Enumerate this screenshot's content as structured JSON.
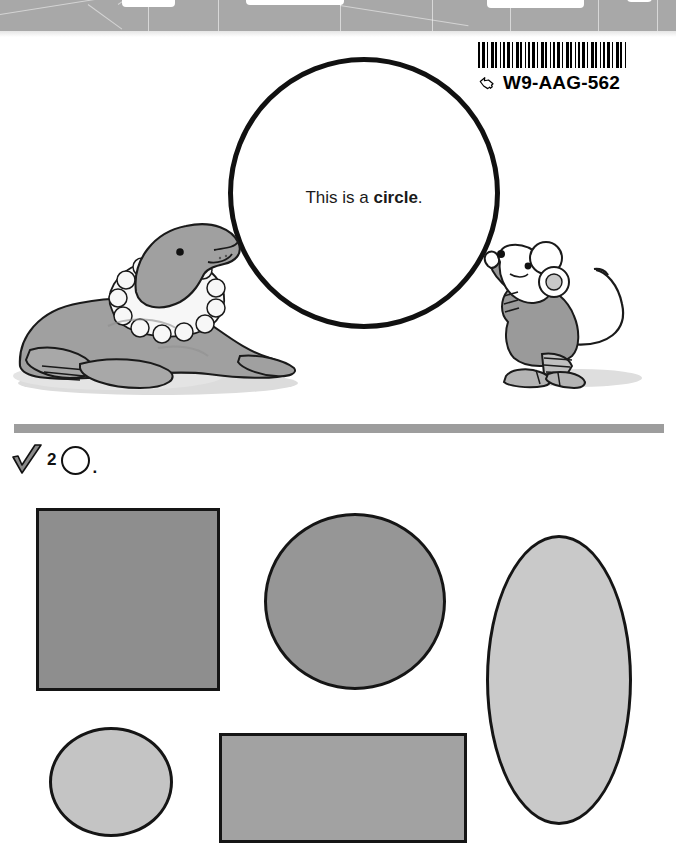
{
  "page": {
    "background_color": "#ffffff",
    "width": 676,
    "height": 868
  },
  "scan_band": {
    "name": "page-edge-scan-artifact",
    "color": "#a8a8a8",
    "notches": [
      {
        "left": 122,
        "width": 53,
        "height": 11
      },
      {
        "left": 246,
        "width": 98,
        "height": 9
      },
      {
        "left": 487,
        "width": 97,
        "height": 12
      },
      {
        "left": 627,
        "width": 25,
        "height": 6
      }
    ]
  },
  "barcode": {
    "code": "W9-AAG-562",
    "hand_icon": "hand-pointer-icon",
    "stripes_label": "barcode-stripes"
  },
  "lesson": {
    "caption_prefix": "This is a ",
    "caption_bold": "circle",
    "caption_suffix": ".",
    "shape_outline_color": "#111111"
  },
  "illustrations": {
    "seal": {
      "name": "seal-illustration",
      "body_color": "#a0a0a0",
      "collar_color": "#f7f7f7",
      "outline_color": "#1a1a1a",
      "shadow_color": "#d9d9d9"
    },
    "mouse": {
      "name": "mouse-illustration",
      "body_color": "#ffffff",
      "dress_color": "#9a9a9a",
      "outline_color": "#1a1a1a",
      "shadow_color": "#d9d9d9"
    }
  },
  "divider": {
    "color": "#9d9d9d"
  },
  "exercise": {
    "check_icon": "checkmark-icon",
    "number": "2",
    "circle_icon": "circle-outline-icon",
    "period": "."
  },
  "shapes": [
    {
      "id": "square",
      "name": "answer-shape-square",
      "label": "square",
      "fill": "#8e8e8e",
      "stroke": "#151515"
    },
    {
      "id": "circle",
      "name": "answer-shape-circle",
      "label": "circle",
      "fill": "#969696",
      "stroke": "#151515"
    },
    {
      "id": "oval",
      "name": "answer-shape-oval",
      "label": "oval",
      "fill": "#c9c9c9",
      "stroke": "#151515"
    },
    {
      "id": "small-circle",
      "name": "answer-shape-small-circle",
      "label": "small circle",
      "fill": "#c4c4c4",
      "stroke": "#151515"
    },
    {
      "id": "rectangle",
      "name": "answer-shape-rectangle",
      "label": "rectangle",
      "fill": "#a2a2a2",
      "stroke": "#151515"
    }
  ]
}
